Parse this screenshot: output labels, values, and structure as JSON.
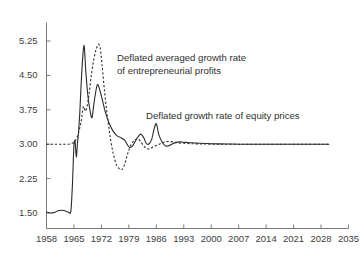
{
  "chart_data": {
    "type": "line",
    "title": "",
    "xlabel": "",
    "ylabel": "",
    "xlim": [
      1958,
      2035
    ],
    "ylim": [
      1.5,
      5.5
    ],
    "grid": false,
    "legend_position": "inline-annotations",
    "y_ticks": [
      "5.25",
      "4.50",
      "3.75",
      "3.00",
      "2.25",
      "1.50"
    ],
    "y_tick_values": [
      5.25,
      4.5,
      3.75,
      3.0,
      2.25,
      1.5
    ],
    "x_ticks": [
      "1958",
      "1965",
      "1972",
      "1979",
      "1986",
      "1993",
      "2000",
      "2007",
      "2014",
      "2021",
      "2028",
      "2035"
    ],
    "x_tick_values": [
      1958,
      1965,
      1972,
      1979,
      1986,
      1993,
      2000,
      2007,
      2014,
      2021,
      2028,
      2035
    ],
    "annotations": [
      {
        "name": "annotation-entrepreneurial-profits",
        "line1": "Deflated averaged growth rate",
        "line2": "of entrepreneurial profits",
        "refers_to": "Deflated averaged growth rate of entrepreneurial profits",
        "style": "dashed"
      },
      {
        "name": "annotation-equity-prices",
        "line1": "Deflated growth rate of equity prices",
        "line2": "",
        "refers_to": "Deflated growth rate of equity prices",
        "style": "solid"
      }
    ],
    "series": [
      {
        "name": "Deflated growth rate of equity prices",
        "style": "solid",
        "color": "#2b2b2b",
        "x": [
          1958,
          1959,
          1960,
          1961,
          1962,
          1963,
          1963.6,
          1964.2,
          1964.6,
          1965.0,
          1965.3,
          1965.6,
          1965.9,
          1966.2,
          1966.5,
          1966.8,
          1967.2,
          1967.6,
          1968.0,
          1968.5,
          1969.0,
          1969.6,
          1970.2,
          1971.0,
          1972.0,
          1973.0,
          1974.0,
          1975.0,
          1976.0,
          1977.0,
          1978.0,
          1978.6,
          1979.2,
          1980.0,
          1981.0,
          1982.0,
          1982.8,
          1983.4,
          1984.0,
          1984.8,
          1985.4,
          1986.0,
          1986.6,
          1987.4,
          1988.2,
          1989.0,
          1990.0,
          1991.0,
          1992.0,
          1993.5,
          1995.0,
          1997.0,
          2000.0,
          2004.0,
          2008.0,
          2014.0,
          2020.0,
          2026.0,
          2030.0
        ],
        "y": [
          1.52,
          1.5,
          1.51,
          1.55,
          1.56,
          1.54,
          1.52,
          1.53,
          2.1,
          2.98,
          3.05,
          2.72,
          3.02,
          3.3,
          3.7,
          4.25,
          4.85,
          5.15,
          4.62,
          4.1,
          3.78,
          3.58,
          3.95,
          4.3,
          4.05,
          3.7,
          3.45,
          3.28,
          3.18,
          3.14,
          3.08,
          2.99,
          2.93,
          2.97,
          3.12,
          3.22,
          3.14,
          3.02,
          3.0,
          3.1,
          3.32,
          3.45,
          3.22,
          3.06,
          2.97,
          2.96,
          3.0,
          3.04,
          3.05,
          3.04,
          3.03,
          3.02,
          3.01,
          3.005,
          3.0,
          3.0,
          3.0,
          3.0,
          3.0
        ]
      },
      {
        "name": "Deflated averaged growth rate of entrepreneurial profits",
        "style": "dashed",
        "color": "#2b2b2b",
        "x": [
          1958,
          1960,
          1962,
          1963.5,
          1964.5,
          1965.2,
          1966.0,
          1966.8,
          1967.4,
          1967.9,
          1968.4,
          1968.9,
          1969.4,
          1970.0,
          1970.6,
          1971.2,
          1971.7,
          1972.2,
          1972.8,
          1973.5,
          1974.2,
          1975.0,
          1975.8,
          1976.6,
          1977.3,
          1978.0,
          1978.8,
          1979.6,
          1980.4,
          1981.2,
          1982.0,
          1982.8,
          1983.6,
          1984.4,
          1985.2,
          1986.2,
          1987.2,
          1988.2,
          1989.2,
          1990.2,
          1991.5,
          1993.0,
          1995.0,
          1998.0,
          2002.0,
          2008.0,
          2015.0,
          2022.0,
          2030.0
        ],
        "y": [
          3.0,
          3.0,
          3.0,
          3.0,
          3.02,
          3.06,
          3.2,
          3.48,
          3.82,
          3.72,
          3.85,
          4.12,
          4.48,
          4.82,
          5.05,
          5.18,
          5.1,
          4.7,
          4.15,
          3.62,
          3.18,
          2.8,
          2.56,
          2.46,
          2.45,
          2.58,
          2.82,
          3.0,
          3.08,
          3.12,
          3.06,
          2.96,
          2.9,
          2.9,
          2.94,
          2.98,
          3.02,
          3.05,
          3.06,
          3.05,
          3.03,
          3.02,
          3.01,
          3.005,
          3.0,
          3.0,
          3.0,
          3.0,
          3.0
        ]
      }
    ]
  }
}
